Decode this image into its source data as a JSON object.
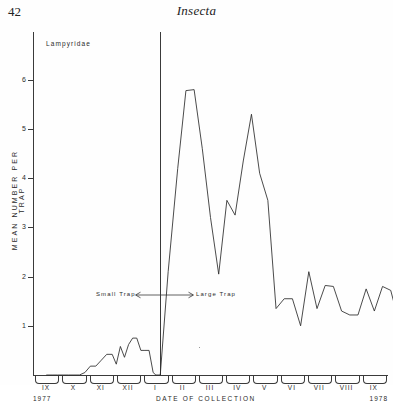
{
  "page": {
    "folio": "42",
    "running_head": "Insecta"
  },
  "figure": {
    "taxon_label": "Lampyridae",
    "divider_annotation": {
      "left_label": "Small Trap",
      "right_label": "Large Trap",
      "left_arrow": "←",
      "right_arrow": "→"
    },
    "year_left": "1977",
    "year_right": "1978"
  },
  "chart_data": {
    "type": "line",
    "title": "Lampyridae",
    "xlabel": "DATE  OF  COLLECTION",
    "ylabel": "MEAN NUMBER PER TRAP",
    "ylim": [
      0,
      6.4
    ],
    "yticks": [
      1,
      2,
      3,
      4,
      5,
      6
    ],
    "ytick_labels": [
      "1",
      "2",
      "3",
      "4",
      "5",
      "6"
    ],
    "grid": false,
    "legend": "none",
    "categories": [
      "IX",
      "X",
      "XI",
      "XII",
      "I",
      "II",
      "III",
      "IV",
      "V",
      "VI",
      "VII",
      "VIII",
      "IX"
    ],
    "category_years": [
      "1977",
      "1977",
      "1977",
      "1977",
      "1978",
      "1978",
      "1978",
      "1978",
      "1978",
      "1978",
      "1978",
      "1978",
      "1978"
    ],
    "annotations": [
      {
        "text": "Small Trap",
        "type": "regime-left"
      },
      {
        "text": "Large Trap",
        "type": "regime-right"
      },
      {
        "text": "1977",
        "type": "year-start"
      },
      {
        "text": "1978",
        "type": "year-end"
      }
    ],
    "divider_x_category": "I",
    "series": [
      {
        "name": "Lampyridae mean per trap",
        "x": [
          0.0,
          0.2,
          0.4,
          0.6,
          0.8,
          1.0,
          1.2,
          1.4,
          1.6,
          1.8,
          2.0,
          2.2,
          2.4,
          2.55,
          2.7,
          2.85,
          3.0,
          3.15,
          3.3,
          3.45,
          3.6,
          3.75,
          3.9,
          4.0,
          4.08,
          4.16,
          4.45,
          4.8,
          5.1,
          5.4,
          5.7,
          6.0,
          6.3,
          6.6,
          6.9,
          7.2,
          7.5,
          7.8,
          8.1,
          8.4,
          8.7,
          9.0,
          9.3,
          9.6,
          9.9,
          10.2,
          10.5,
          10.8,
          11.1,
          11.4,
          11.7,
          12.0,
          12.3,
          12.6,
          12.9
        ],
        "values": [
          0.0,
          0.0,
          0.0,
          0.0,
          0.0,
          0.0,
          0.0,
          0.05,
          0.18,
          0.18,
          0.3,
          0.42,
          0.42,
          0.22,
          0.58,
          0.36,
          0.62,
          0.75,
          0.75,
          0.5,
          0.5,
          0.5,
          0.05,
          0.0,
          0.0,
          0.0,
          2.1,
          4.2,
          5.78,
          5.8,
          4.6,
          3.2,
          2.05,
          3.55,
          3.25,
          4.35,
          5.3,
          4.1,
          3.55,
          1.35,
          1.55,
          1.55,
          1.0,
          2.1,
          1.35,
          1.82,
          1.8,
          1.3,
          1.22,
          1.22,
          1.75,
          1.3,
          1.8,
          1.72,
          1.08
        ]
      }
    ],
    "peaks": [
      {
        "label": "primary peak",
        "value": 5.8,
        "month": "II"
      },
      {
        "label": "secondary peak",
        "value": 5.3,
        "month": "IV"
      },
      {
        "label": "inter-peak trough",
        "value": 2.05,
        "month": "III"
      },
      {
        "label": "small-trap maximum",
        "value": 0.75,
        "month": "XII"
      }
    ]
  }
}
